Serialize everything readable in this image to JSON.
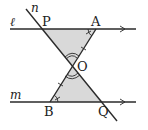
{
  "diagram": {
    "type": "geometry",
    "fill_color": "#d9d9d9",
    "line_color": "#2a2a2a",
    "lines": {
      "l": {
        "label": "ℓ"
      },
      "m": {
        "label": "m"
      },
      "n": {
        "label": "n"
      }
    },
    "points": {
      "P": {
        "label": "P"
      },
      "A": {
        "label": "A"
      },
      "O": {
        "label": "O"
      },
      "B": {
        "label": "B"
      },
      "Q": {
        "label": "Q"
      }
    },
    "triangles": [
      "△OPA",
      "△OQB"
    ],
    "marks": {
      "parallel_arrows": [
        "ℓ",
        "m"
      ],
      "equal_segments": [
        "OA",
        "OB"
      ],
      "equal_angles_single_tick": [
        "∠PAO",
        "∠QBO"
      ],
      "equal_angles_double_arc": [
        "∠POA",
        "∠QOB"
      ]
    }
  }
}
